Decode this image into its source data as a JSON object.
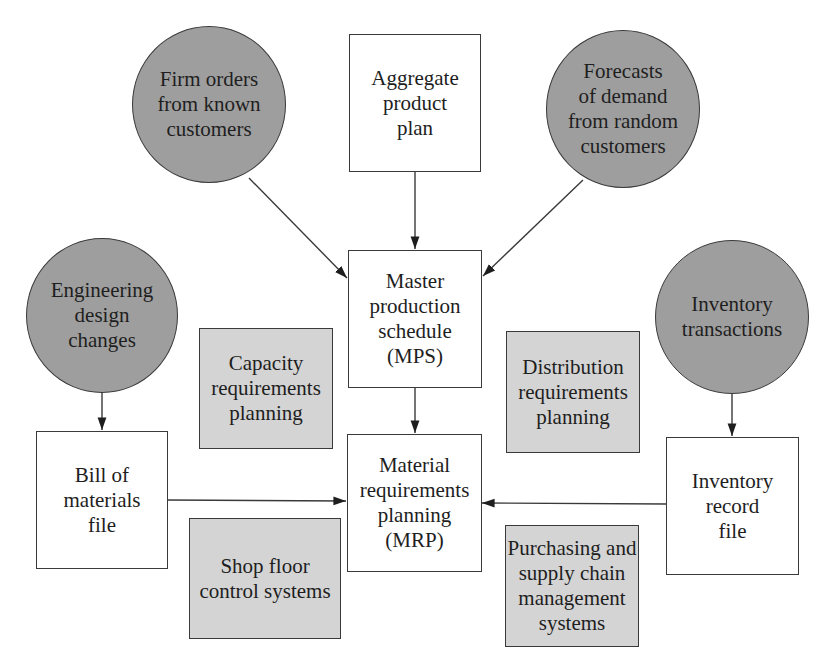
{
  "diagram": {
    "colors": {
      "input_circle_fill": "#9e9e9e",
      "related_system_fill": "#d4d4d4",
      "core_box_fill": "#ffffff",
      "stroke": "#3a3a3a"
    },
    "nodes": {
      "firm_orders": {
        "type": "circle",
        "label": "Firm orders\nfrom known\ncustomers"
      },
      "aggregate_plan": {
        "type": "box",
        "label": "Aggregate\nproduct\nplan"
      },
      "forecasts": {
        "type": "circle",
        "label": "Forecasts\nof demand\nfrom random\ncustomers"
      },
      "engineering_changes": {
        "type": "circle",
        "label": "Engineering\ndesign\nchanges"
      },
      "inventory_transactions": {
        "type": "circle",
        "label": "Inventory\ntransactions"
      },
      "mps": {
        "type": "box",
        "label": "Master\nproduction\nschedule\n(MPS)"
      },
      "capacity_planning": {
        "type": "shaded-box",
        "label": "Capacity\nrequirements\nplanning"
      },
      "distribution_planning": {
        "type": "shaded-box",
        "label": "Distribution\nrequirements\nplanning"
      },
      "bom_file": {
        "type": "box",
        "label": "Bill of\nmaterials\nfile"
      },
      "mrp": {
        "type": "box",
        "label": "Material\nrequirements\nplanning\n(MRP)"
      },
      "inventory_record": {
        "type": "box",
        "label": "Inventory\nrecord\nfile"
      },
      "shop_floor": {
        "type": "shaded-box",
        "label": "Shop floor\ncontrol systems"
      },
      "purchasing": {
        "type": "shaded-box",
        "label": "Purchasing and\nsupply chain\nmanagement\nsystems"
      }
    },
    "edges": [
      {
        "from": "firm_orders",
        "to": "mps"
      },
      {
        "from": "aggregate_plan",
        "to": "mps"
      },
      {
        "from": "forecasts",
        "to": "mps"
      },
      {
        "from": "mps",
        "to": "mrp"
      },
      {
        "from": "engineering_changes",
        "to": "bom_file"
      },
      {
        "from": "bom_file",
        "to": "mrp"
      },
      {
        "from": "inventory_transactions",
        "to": "inventory_record"
      },
      {
        "from": "inventory_record",
        "to": "mrp"
      }
    ]
  }
}
